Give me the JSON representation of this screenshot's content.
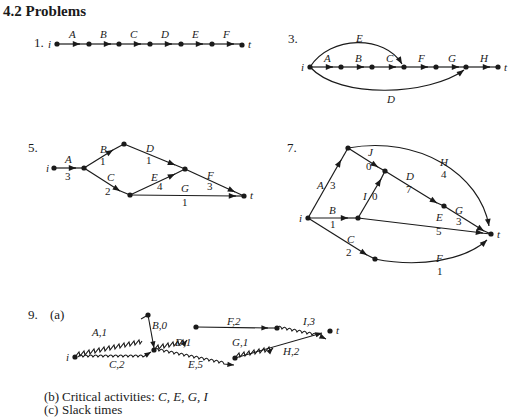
{
  "section": {
    "heading": "4.2 Problems"
  },
  "problems": [
    {
      "number": "1.",
      "nodes": {
        "start": "i",
        "end": "t"
      },
      "activities": [
        "A",
        "B",
        "C",
        "D",
        "E",
        "F"
      ]
    },
    {
      "number": "3.",
      "nodes": {
        "start": "i",
        "end": "t"
      },
      "activities": [
        "A",
        "B",
        "C",
        "D",
        "E",
        "F",
        "G",
        "H"
      ]
    },
    {
      "number": "5.",
      "nodes": {
        "start": "i",
        "end": "t"
      },
      "activities": [
        {
          "name": "A",
          "duration": "3"
        },
        {
          "name": "B",
          "duration": "1"
        },
        {
          "name": "C",
          "duration": "2"
        },
        {
          "name": "D",
          "duration": "1"
        },
        {
          "name": "E",
          "duration": "4"
        },
        {
          "name": "F",
          "duration": "3"
        },
        {
          "name": "G",
          "duration": "1"
        }
      ]
    },
    {
      "number": "7.",
      "nodes": {
        "start": "i",
        "end": "t"
      },
      "activities": [
        {
          "name": "A",
          "duration": "3"
        },
        {
          "name": "B",
          "duration": "1"
        },
        {
          "name": "C",
          "duration": "2"
        },
        {
          "name": "D",
          "duration": "7"
        },
        {
          "name": "E",
          "duration": "5"
        },
        {
          "name": "F",
          "duration": "1"
        },
        {
          "name": "G",
          "duration": "3"
        },
        {
          "name": "H",
          "duration": "4"
        },
        {
          "name": "I",
          "duration": "0"
        },
        {
          "name": "J",
          "duration": "0"
        }
      ]
    },
    {
      "number": "9.",
      "part_a": "(a)",
      "nodes": {
        "start": "i",
        "end": "t"
      },
      "activities": [
        {
          "label": "A,1"
        },
        {
          "label": "B,0"
        },
        {
          "label": "C,2"
        },
        {
          "label": "D,1"
        },
        {
          "label": "E,5"
        },
        {
          "label": "F,2"
        },
        {
          "label": "G,1"
        },
        {
          "label": "H,2"
        },
        {
          "label": "I,3"
        }
      ],
      "part_b": {
        "label": "(b)",
        "text": "Critical activities: ",
        "items": "C, E, G, I"
      },
      "part_c": {
        "label": "(c)",
        "text": "Slack times"
      }
    }
  ]
}
